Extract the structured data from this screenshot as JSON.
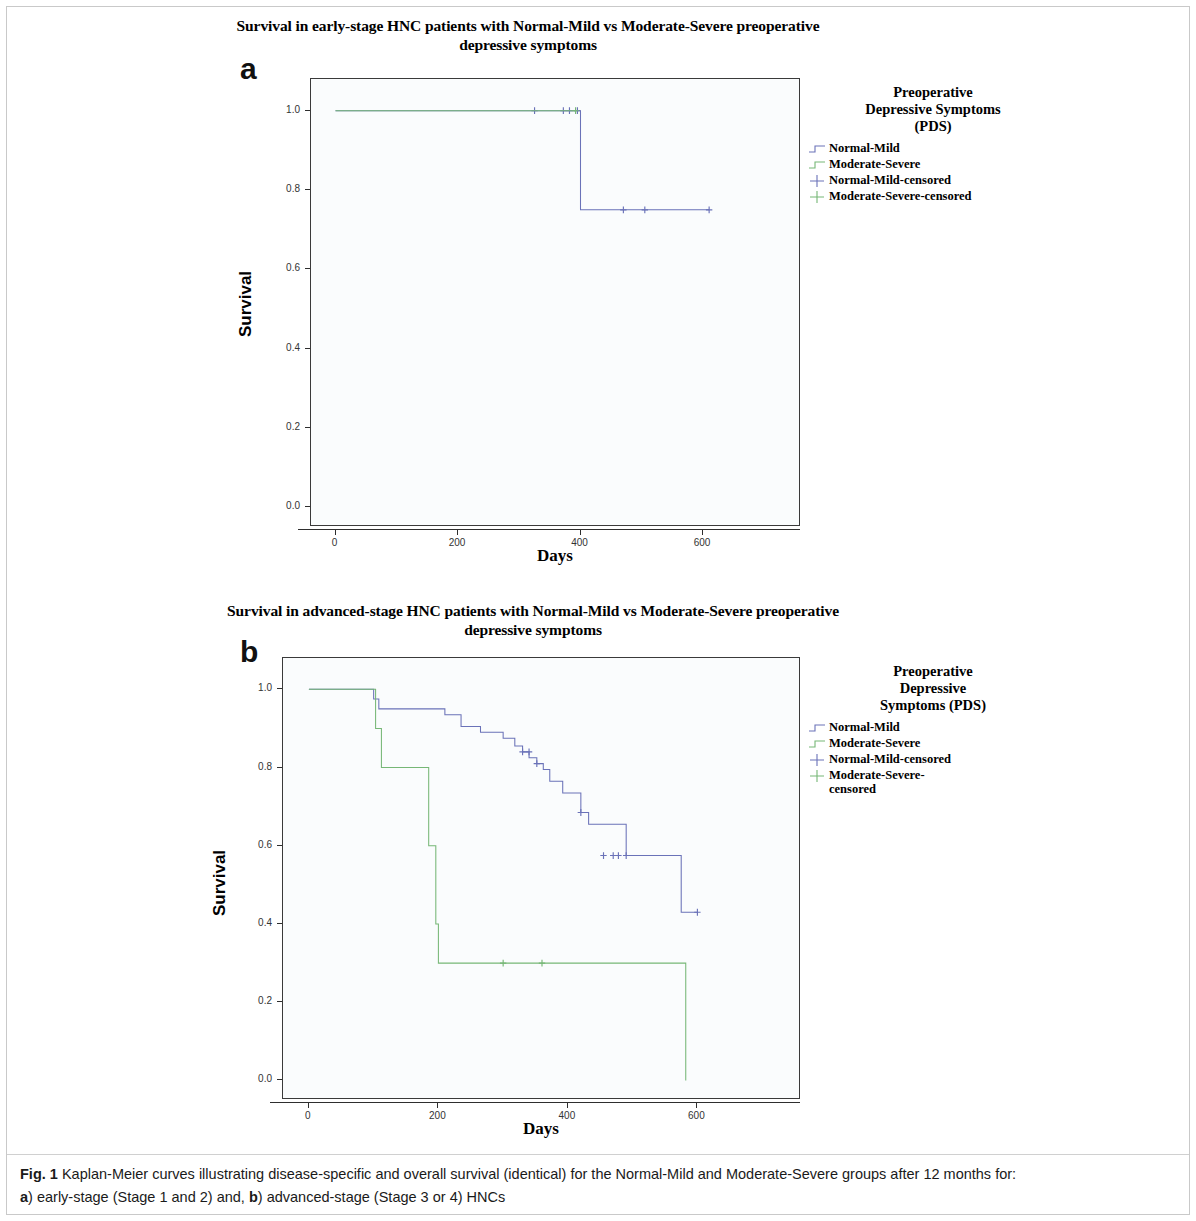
{
  "figure": {
    "caption_label": "Fig. 1",
    "caption_text": " Kaplan-Meier curves illustrating disease-specific and overall survival (identical) for the Normal-Mild and Moderate-Severe groups after 12 months for:",
    "caption_line2_a": "a",
    "caption_line2_mid": ") early-stage (Stage 1 and 2) and, ",
    "caption_line2_b": "b",
    "caption_line2_end": ") advanced-stage (Stage 3 or 4) HNCs"
  },
  "colors": {
    "normal_mild": "#6a72b8",
    "moderate_severe": "#76b776",
    "axis": "#2e2e2e",
    "plot_bg": "#fafcfd",
    "plot_border": "#3a3a3a"
  },
  "panel_a": {
    "letter": "a",
    "title_line1": "Survival in early-stage HNC patients with Normal-Mild vs Moderate-Severe preoperative",
    "title_line2": "depressive symptoms",
    "legend": {
      "title_line1": "Preoperative",
      "title_line2": "Depressive Symptoms",
      "title_line3": "(PDS)",
      "items": [
        {
          "label": "Normal-Mild",
          "key": "step",
          "color": "#6a72b8"
        },
        {
          "label": "Moderate-Severe",
          "key": "step",
          "color": "#76b776"
        },
        {
          "label": "Normal-Mild-censored",
          "key": "plus",
          "color": "#6a72b8"
        },
        {
          "label": "Moderate-Severe-censored",
          "key": "plus",
          "color": "#76b776"
        }
      ]
    }
  },
  "panel_b": {
    "letter": "b",
    "title_line1": "Survival in advanced-stage HNC patients with Normal-Mild vs Moderate-Severe preoperative",
    "title_line2": "depressive symptoms",
    "legend": {
      "title_line1": "Preoperative",
      "title_line2": "Depressive",
      "title_line3": "Symptoms (PDS)",
      "items": [
        {
          "label": "Normal-Mild",
          "key": "step",
          "color": "#6a72b8"
        },
        {
          "label": "Moderate-Severe",
          "key": "step",
          "color": "#76b776"
        },
        {
          "label": "Normal-Mild-censored",
          "key": "plus",
          "color": "#6a72b8"
        },
        {
          "label": "Moderate-Severe-\ncensored",
          "key": "plus",
          "color": "#76b776"
        }
      ]
    }
  },
  "chart_data": [
    {
      "id": "panel-a",
      "type": "line",
      "title": "Survival in early-stage HNC patients with Normal-Mild vs Moderate-Severe preoperative depressive symptoms",
      "xlabel": "Days",
      "ylabel": "Survival",
      "xlim": [
        -40,
        760
      ],
      "ylim": [
        -0.05,
        1.08
      ],
      "xticks": [
        0,
        200,
        400,
        600
      ],
      "xtick_labels": [
        "0",
        "200",
        "400",
        "600"
      ],
      "yticks": [
        0.0,
        0.2,
        0.4,
        0.6,
        0.8,
        1.0
      ],
      "ytick_labels": [
        "0.0",
        "0.2",
        "0.4",
        "0.6",
        "0.8",
        "1.0"
      ],
      "grid": false,
      "legend_position": "right",
      "series": [
        {
          "name": "Normal-Mild",
          "color": "#6a72b8",
          "step": "post",
          "x": [
            0,
            400,
            400,
            610
          ],
          "y": [
            1.0,
            1.0,
            0.75,
            0.75
          ],
          "censored_x": [
            325,
            372,
            382,
            395,
            470,
            505,
            610
          ],
          "censored_y": [
            1.0,
            1.0,
            1.0,
            1.0,
            0.75,
            0.75,
            0.75
          ]
        },
        {
          "name": "Moderate-Severe",
          "color": "#76b776",
          "step": "post",
          "x": [
            0,
            392
          ],
          "y": [
            1.0,
            1.0
          ],
          "censored_x": [
            392
          ],
          "censored_y": [
            1.0
          ]
        }
      ]
    },
    {
      "id": "panel-b",
      "type": "line",
      "title": "Survival in advanced-stage HNC patients with Normal-Mild vs Moderate-Severe preoperative depressive symptoms",
      "xlabel": "Days",
      "ylabel": "Survival",
      "xlim": [
        -40,
        760
      ],
      "ylim": [
        -0.05,
        1.08
      ],
      "xticks": [
        0,
        200,
        400,
        600
      ],
      "xtick_labels": [
        "0",
        "200",
        "400",
        "600"
      ],
      "yticks": [
        0.0,
        0.2,
        0.4,
        0.6,
        0.8,
        1.0
      ],
      "ytick_labels": [
        "0.0",
        "0.2",
        "0.4",
        "0.6",
        "0.8",
        "1.0"
      ],
      "grid": false,
      "legend_position": "right",
      "series": [
        {
          "name": "Normal-Mild",
          "color": "#6a72b8",
          "step": "post",
          "x": [
            0,
            100,
            100,
            108,
            108,
            210,
            210,
            235,
            235,
            265,
            265,
            300,
            300,
            318,
            318,
            330,
            330,
            340,
            340,
            352,
            352,
            362,
            362,
            372,
            372,
            392,
            392,
            420,
            420,
            432,
            432,
            490,
            490,
            575,
            575,
            600
          ],
          "y": [
            1.0,
            1.0,
            0.975,
            0.975,
            0.95,
            0.95,
            0.935,
            0.935,
            0.905,
            0.905,
            0.89,
            0.89,
            0.875,
            0.875,
            0.855,
            0.855,
            0.84,
            0.84,
            0.825,
            0.825,
            0.81,
            0.81,
            0.795,
            0.795,
            0.765,
            0.765,
            0.735,
            0.735,
            0.685,
            0.685,
            0.655,
            0.655,
            0.575,
            0.575,
            0.43,
            0.43
          ],
          "censored_x": [
            330,
            340,
            352,
            420,
            455,
            470,
            478,
            490,
            600
          ],
          "censored_y": [
            0.84,
            0.84,
            0.81,
            0.685,
            0.575,
            0.575,
            0.575,
            0.575,
            0.43
          ]
        },
        {
          "name": "Moderate-Severe",
          "color": "#76b776",
          "step": "post",
          "x": [
            0,
            103,
            103,
            112,
            112,
            185,
            185,
            196,
            196,
            200,
            200,
            582,
            582
          ],
          "y": [
            1.0,
            1.0,
            0.9,
            0.9,
            0.8,
            0.8,
            0.6,
            0.6,
            0.4,
            0.4,
            0.3,
            0.3,
            0.0
          ],
          "censored_x": [
            300,
            360
          ],
          "censored_y": [
            0.3,
            0.3
          ]
        }
      ]
    }
  ]
}
